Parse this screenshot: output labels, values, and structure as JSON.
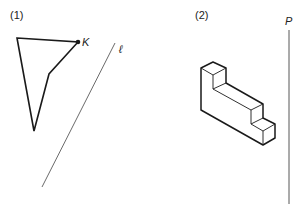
{
  "figures": [
    {
      "label": "(1)",
      "point_label": "K",
      "line_label": "ℓ",
      "polygon": [
        [
          17,
          38
        ],
        [
          78,
          42
        ],
        [
          49,
          74
        ],
        [
          34,
          131
        ]
      ],
      "line": [
        [
          115,
          43
        ],
        [
          42,
          187
        ]
      ]
    },
    {
      "label": "(2)",
      "plane_label": "P",
      "plane_line": [
        [
          289,
          30
        ],
        [
          289,
          204
        ]
      ]
    }
  ],
  "colors": {
    "stroke": "#1a1a1a",
    "thin": "#444444"
  }
}
